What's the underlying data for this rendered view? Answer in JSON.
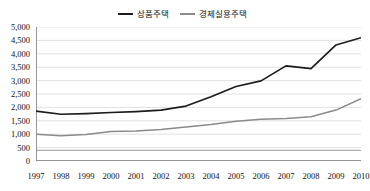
{
  "chart_data": {
    "type": "line",
    "title": "",
    "subtitle": "",
    "xlabel": "",
    "ylabel": "",
    "grid": true,
    "legend_position": "top-center",
    "ylim": [
      0,
      5000
    ],
    "ytick_step": 500,
    "ytick_labels": [
      "5,000",
      "4,500",
      "4,000",
      "3,500",
      "3,000",
      "2,500",
      "2,000",
      "1,500",
      "1,000",
      "500",
      "0"
    ],
    "ytick_values": [
      5000,
      4500,
      4000,
      3500,
      3000,
      2500,
      2000,
      1500,
      1000,
      500,
      0
    ],
    "categories": [
      "1997",
      "1998",
      "1999",
      "2000",
      "2001",
      "2002",
      "2003",
      "2004",
      "2005",
      "2006",
      "2007",
      "2008",
      "2009",
      "2010"
    ],
    "x": [
      1997,
      1998,
      1999,
      2000,
      2001,
      2002,
      2003,
      2004,
      2005,
      2006,
      2007,
      2008,
      2009,
      2010
    ],
    "series": [
      {
        "name": "상품주택",
        "color": "#1c1c1c",
        "values": [
          1860,
          1745,
          1770,
          1810,
          1845,
          1900,
          2050,
          2400,
          2780,
          2990,
          3550,
          3450,
          4330,
          4600
        ]
      },
      {
        "name": "경제실용주택",
        "color": "#8a8a8a",
        "values": [
          1000,
          945,
          990,
          1100,
          1120,
          1180,
          1270,
          1360,
          1480,
          1560,
          1590,
          1650,
          1900,
          2330
        ]
      }
    ]
  },
  "legend": {
    "entries": [
      {
        "label": "상품주택",
        "color": "#1c1c1c"
      },
      {
        "label": "경제실용주택",
        "color": "#8a8a8a"
      }
    ]
  },
  "axis": {
    "baseline_color": "#7d7d7d",
    "gridline_color": "#d4d4d4"
  }
}
